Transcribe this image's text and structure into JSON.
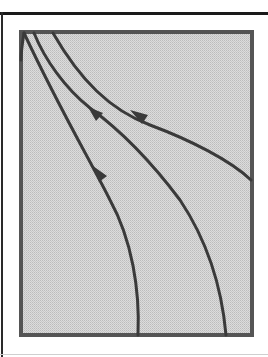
{
  "diagram": {
    "type": "streamline-flow-diagram",
    "frame": {
      "x": 20,
      "y": 31,
      "width": 233,
      "height": 305,
      "fill": "#d8d8d8",
      "stroke": "#555555"
    },
    "line_color": "#3c3c3c",
    "flow_lines": [
      {
        "id": "line-1",
        "start": "bottom edge x≈138",
        "end": "top-left corner",
        "arrows": 1
      },
      {
        "id": "line-2",
        "start": "bottom edge x≈226",
        "end": "top edge x≈35",
        "arrows": 1
      },
      {
        "id": "line-3",
        "start": "right edge y≈180",
        "end": "top edge x≈53",
        "arrows": 1
      },
      {
        "id": "line-4",
        "start": "top-left corner",
        "end": "left edge",
        "arrows": 0
      }
    ],
    "arrow_direction": "up-left"
  }
}
